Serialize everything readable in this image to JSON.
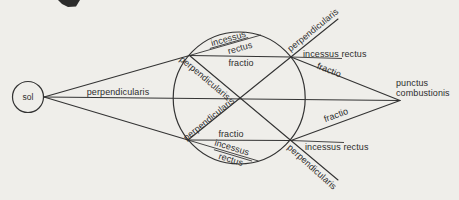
{
  "colors": {
    "background": "#efeeea",
    "ink": "#333333",
    "text": "#2d2d2d"
  },
  "sun": {
    "label": "sol"
  },
  "axis": {
    "label": "perpendicularis"
  },
  "lens_top": {
    "entry": {
      "normal_label": "perpendicularis",
      "straight_word1": "incessus",
      "straight_word2": "rectus",
      "refracted_label": "fractio"
    },
    "exit": {
      "normal_label": "perpendicularis",
      "straight_label": "incessus rectus",
      "refracted_label": "fractio"
    }
  },
  "lens_bottom": {
    "entry": {
      "normal_label": "perpendicularis",
      "straight_word1": "incessus",
      "straight_word2": "rectus",
      "refracted_label": "fractio"
    },
    "exit": {
      "normal_label": "perpendicularis",
      "straight_label": "incessus rectus",
      "refracted_label": "fractio"
    }
  },
  "focus": {
    "label_line1": "punctus",
    "label_line2": "combustionis"
  }
}
